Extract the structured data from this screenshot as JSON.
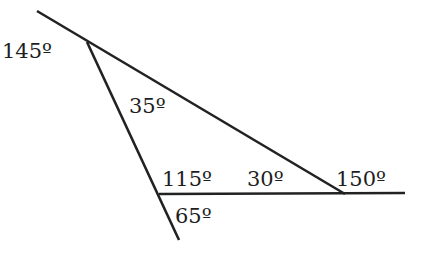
{
  "diagram": {
    "type": "triangle-with-extended-sides",
    "stroke_color": "#222222",
    "lines": [
      {
        "id": "upper-transversal",
        "x1": 37,
        "y1": 11,
        "x2": 345,
        "y2": 194
      },
      {
        "id": "left-side",
        "x1": 87,
        "y1": 42,
        "x2": 179,
        "y2": 240
      },
      {
        "id": "base-line",
        "x1": 159,
        "y1": 194,
        "x2": 405,
        "y2": 193
      }
    ],
    "angles": [
      {
        "id": "exterior-top",
        "label": "145º",
        "x": 2,
        "y": 41
      },
      {
        "id": "interior-top",
        "label": "35º",
        "x": 129,
        "y": 96
      },
      {
        "id": "interior-bottom-left",
        "label": "115º",
        "x": 162,
        "y": 169
      },
      {
        "id": "interior-right",
        "label": "30º",
        "x": 247,
        "y": 169
      },
      {
        "id": "exterior-right",
        "label": "150º",
        "x": 336,
        "y": 169
      },
      {
        "id": "exterior-bottom-left",
        "label": "65º",
        "x": 175,
        "y": 206
      }
    ]
  }
}
